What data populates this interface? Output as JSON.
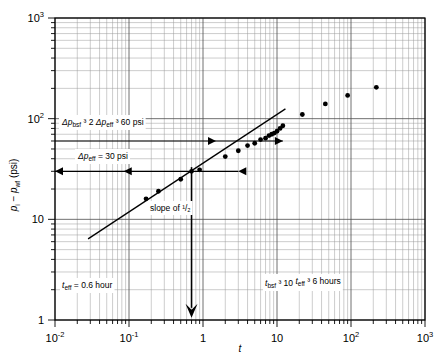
{
  "figure": {
    "title": "",
    "background_color": "#ffffff",
    "frame_color": "#000000",
    "grid_color": "#8a8a8a",
    "data_color": "#000000"
  },
  "axes": {
    "x": {
      "label": "t",
      "scale": "log",
      "min": 0.01,
      "max": 1000,
      "tick_labels": [
        "10",
        "10",
        "1",
        "10",
        "10",
        "10"
      ],
      "tick_exponents": [
        "-2",
        "-1",
        "",
        "",
        "2",
        "3"
      ],
      "tick_values": [
        0.01,
        0.1,
        1,
        10,
        100,
        1000
      ]
    },
    "y": {
      "label_parts": {
        "p1": "p",
        "sub1": "i",
        "minus": "−",
        "p2": "p",
        "sub2": "wf",
        "units": "(psi)"
      },
      "label": "p i − p wf (psi)",
      "scale": "log",
      "min": 1,
      "max": 1000,
      "tick_labels": [
        "10",
        "10",
        "1"
      ],
      "tick_exponents": [
        "3",
        "2",
        ""
      ],
      "tick_values": [
        1000,
        100,
        10,
        1
      ]
    }
  },
  "annotations": {
    "top_note": {
      "name": "delta-p-bsf-note",
      "parts": [
        {
          "text": "Δp",
          "style": "italic"
        },
        {
          "text": "bsf",
          "style": "sub"
        },
        {
          "text": "³",
          "style": "sup"
        },
        {
          "text": "2 ",
          "style": "normal"
        },
        {
          "text": "Δp",
          "style": "italic"
        },
        {
          "text": "eff",
          "style": "sub"
        },
        {
          "text": "³",
          "style": "sup"
        },
        {
          "text": "60 psi",
          "style": "normal"
        }
      ],
      "plain": "Δp bsf ³ 2 Δp eff ³ 60 psi"
    },
    "mid_note": {
      "name": "delta-p-eff-note",
      "parts": [
        {
          "text": "Δp",
          "style": "italic"
        },
        {
          "text": "eff",
          "style": "sub"
        },
        {
          "text": " = 30 psi",
          "style": "normal"
        }
      ],
      "plain": "Δp eff = 30 psi"
    },
    "slope_note": {
      "name": "slope-note",
      "prefix": "slope of ",
      "fraction": "¹/₂",
      "plain": "slope of 1/2"
    },
    "t_eff_note": {
      "name": "t-eff-note",
      "parts": [
        {
          "text": "t",
          "style": "italic"
        },
        {
          "text": "eff",
          "style": "sub"
        },
        {
          "text": " = 0.6 hour",
          "style": "normal"
        }
      ],
      "plain": "t eff = 0.6 hour"
    },
    "t_bsf_note": {
      "name": "t-bsf-note",
      "parts": [
        {
          "text": "t",
          "style": "italic"
        },
        {
          "text": "bsf",
          "style": "sub"
        },
        {
          "text": "³",
          "style": "sup"
        },
        {
          "text": "10 ",
          "style": "normal"
        },
        {
          "text": "t",
          "style": "italic"
        },
        {
          "text": "eff",
          "style": "sub"
        },
        {
          "text": "³",
          "style": "sup"
        },
        {
          "text": "6 hours",
          "style": "normal"
        }
      ],
      "plain": "t bsf ³ 10 t eff ³ 6 hours"
    }
  },
  "chart_data": {
    "type": "scatter",
    "title": "",
    "xlabel": "t",
    "ylabel": "p_i − p_wf (psi)",
    "xscale": "log",
    "yscale": "log",
    "xlim": [
      0.01,
      1000
    ],
    "ylim": [
      1,
      1000
    ],
    "grid": true,
    "legend": null,
    "series": [
      {
        "name": "measured drawdown",
        "marker": "filled-circle",
        "x": [
          0.17,
          0.25,
          0.5,
          0.7,
          0.9,
          2.0,
          3.0,
          4.0,
          5.0,
          6.0,
          7.0,
          7.8,
          8.5,
          9.2,
          10.0,
          11.0,
          12.0,
          22.0,
          45.0,
          90.0,
          220.0
        ],
        "y": [
          16,
          19,
          25,
          30,
          31,
          42,
          48,
          54,
          57,
          62,
          64,
          68,
          70,
          72,
          75,
          80,
          85,
          110,
          140,
          170,
          205
        ]
      },
      {
        "name": "half-slope straight line",
        "type": "line",
        "x": [
          0.028,
          13.0
        ],
        "y": [
          6.4,
          125.0
        ],
        "slope": 0.5
      }
    ],
    "reference_lines": [
      {
        "name": "delta-p-bsf-level",
        "orientation": "horizontal",
        "y": 60,
        "x_from": 0.01,
        "x_to": 12.0,
        "arrow_heads": [
          "right",
          "right"
        ]
      },
      {
        "name": "delta-p-eff-level",
        "orientation": "horizontal",
        "y": 30,
        "x_from": 0.01,
        "x_to": 3.0,
        "arrow_heads": [
          "left",
          "left",
          "left"
        ]
      },
      {
        "name": "t-eff-marker",
        "orientation": "vertical",
        "x": 0.7,
        "y_from": 33,
        "y_to": 1.05,
        "arrow_heads": [
          "down"
        ]
      }
    ]
  }
}
